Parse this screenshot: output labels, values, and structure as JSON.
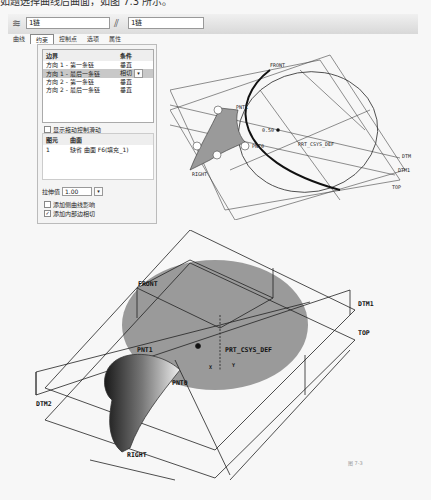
{
  "caption": "如题选择曲线后曲面，如图 7.3 所示。",
  "toolbar": {
    "dir1_icon": "boundary-dir1-icon",
    "dir1_value": "1链",
    "dir2_icon": "boundary-dir2-icon",
    "dir2_value": "1链"
  },
  "tabs": [
    {
      "label": "曲线",
      "active": false
    },
    {
      "label": "约束",
      "active": true
    },
    {
      "label": "控制点",
      "active": false
    },
    {
      "label": "选项",
      "active": false
    },
    {
      "label": "属性",
      "active": false
    }
  ],
  "constraints": {
    "headers": [
      "边界",
      "条件"
    ],
    "rows": [
      {
        "boundary": "方向 1 - 第一条链",
        "condition": "垂直",
        "selected": false
      },
      {
        "boundary": "方向 1 - 最后一条链",
        "condition": "相切",
        "selected": true
      },
      {
        "boundary": "方向 2 - 第一条链",
        "condition": "垂直",
        "selected": false
      },
      {
        "boundary": "方向 2 - 最后一条链",
        "condition": "垂直",
        "selected": false
      }
    ]
  },
  "show_drag_handles": {
    "label": "显示拖动控制滑动",
    "checked": false
  },
  "reference_table": {
    "headers": [
      "图元",
      "曲面"
    ],
    "rows": [
      {
        "index": "1",
        "surface": "缺省 曲面 F6(填充_1)"
      }
    ]
  },
  "stretch": {
    "label": "拉伸值",
    "value": "1.00"
  },
  "options": [
    {
      "label": "添加侧曲线影响",
      "checked": false
    },
    {
      "label": "添加内部边相切",
      "checked": true
    }
  ],
  "top_view_labels": {
    "front": "FRONT",
    "pnt1": "PNT1",
    "pnt0": "PNT0",
    "dim": "0.50",
    "csys": "PRT_CSYS_DEF",
    "dtm1": "DTM1",
    "top": "TOP",
    "right": "RIGHT",
    "dtm": "DTM"
  },
  "bottom_view_labels": {
    "front": "FRONT",
    "dtm1": "DTM1",
    "top": "TOP",
    "pnt1": "PNT1",
    "csys": "PRT_CSYS_DEF",
    "pnt0": "PNT0",
    "dtm2": "DTM2",
    "right": "RIGHT",
    "axis_x": "X",
    "axis_y": "Y"
  },
  "figure_label": "图 7-3",
  "colors": {
    "surface_gray": "#9a9a9a",
    "selected_row": "#c8c8c8"
  }
}
